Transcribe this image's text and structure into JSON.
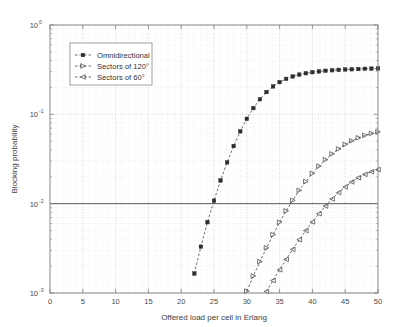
{
  "chart_data": {
    "type": "line",
    "title": "",
    "xlabel": "Offered load per cell in Erlang",
    "ylabel": "Blocking probability",
    "xlim": [
      0,
      50
    ],
    "ylim": [
      0.001,
      1
    ],
    "yscale": "log",
    "xscale": "linear",
    "grid": true,
    "grid_style": "dotted",
    "legend_position": "upper-left-inside",
    "xticks": [
      0,
      5,
      10,
      15,
      20,
      25,
      30,
      35,
      40,
      45,
      50
    ],
    "xtick_labels": [
      "0",
      "5",
      "10",
      "15",
      "20",
      "25",
      "30",
      "35",
      "40",
      "45",
      "50"
    ],
    "yticks": [
      1,
      0.1,
      0.01,
      0.001
    ],
    "ytick_labels": [
      "10^0",
      "10^-1",
      "10^-2",
      "10^-3"
    ],
    "ytick_bases": [
      "10",
      "10",
      "10",
      "10"
    ],
    "ytick_exponents": [
      "0",
      "-1",
      "-2",
      "-3"
    ],
    "annotations": [
      {
        "name": "reference-line",
        "type": "hline",
        "y": 0.01,
        "label": ""
      }
    ],
    "series": [
      {
        "name": "Omnidirectional",
        "marker": "filled-square",
        "linestyle": "dashed",
        "x": [
          22.0,
          23.0,
          24.0,
          25.0,
          26.0,
          27.0,
          28.0,
          29.0,
          30.0,
          31.0,
          32.0,
          33.0,
          34.0,
          35.0,
          36.0,
          37.0,
          38.0,
          39.0,
          40.0,
          41.0,
          42.0,
          43.0,
          44.0,
          45.0,
          46.0,
          47.0,
          48.0,
          49.0,
          50.0
        ],
        "y": [
          0.00165,
          0.0033,
          0.0062,
          0.0108,
          0.0182,
          0.029,
          0.0442,
          0.0645,
          0.089,
          0.1175,
          0.1475,
          0.1775,
          0.2055,
          0.2295,
          0.2495,
          0.2655,
          0.2785,
          0.2885,
          0.2965,
          0.3025,
          0.3075,
          0.3115,
          0.3145,
          0.3175,
          0.3195,
          0.3215,
          0.3235,
          0.325,
          0.326
        ]
      },
      {
        "name": "Sectors of 120°",
        "marker": "right-triangle",
        "linestyle": "dashed",
        "x": [
          30.0,
          31.0,
          32.0,
          33.0,
          34.0,
          35.0,
          36.0,
          37.0,
          38.0,
          39.0,
          40.0,
          41.0,
          42.0,
          43.0,
          44.0,
          45.0,
          46.0,
          47.0,
          48.0,
          49.0,
          50.0
        ],
        "y": [
          0.00105,
          0.00155,
          0.00225,
          0.0032,
          0.0045,
          0.0062,
          0.0083,
          0.0109,
          0.0141,
          0.0177,
          0.0218,
          0.0263,
          0.0311,
          0.0361,
          0.041,
          0.0459,
          0.0505,
          0.0546,
          0.0582,
          0.0612,
          0.0637
        ]
      },
      {
        "name": "Sectors of 60°",
        "marker": "left-triangle",
        "linestyle": "dashed",
        "x": [
          33.0,
          34.0,
          35.0,
          36.0,
          37.0,
          38.0,
          39.0,
          40.0,
          41.0,
          42.0,
          43.0,
          44.0,
          45.0,
          46.0,
          47.0,
          48.0,
          49.0,
          50.0
        ],
        "y": [
          0.00104,
          0.00138,
          0.00182,
          0.00238,
          0.00308,
          0.00395,
          0.005,
          0.00625,
          0.00772,
          0.0094,
          0.0113,
          0.0133,
          0.0154,
          0.0175,
          0.0195,
          0.0213,
          0.0228,
          0.0241
        ]
      }
    ]
  },
  "legend": {
    "entries": [
      {
        "label": "Omnidirectional",
        "marker": "filled-square"
      },
      {
        "label": "Sectors of 120°",
        "marker": "right-triangle"
      },
      {
        "label": "Sectors of 60°",
        "marker": "left-triangle"
      }
    ]
  },
  "colors": {
    "background": "#ffffff",
    "axis": "#7d7d7d",
    "grid_major": "#b9b9b9",
    "grid_minor": "#d8d8d8",
    "series_line": "#4a4a4a",
    "marker_fill": "#2e2e2e",
    "text": "#3a3a3a"
  }
}
